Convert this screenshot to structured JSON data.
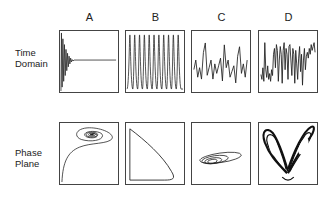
{
  "columns": [
    {
      "id": "A",
      "label": "A"
    },
    {
      "id": "B",
      "label": "B"
    },
    {
      "id": "C",
      "label": "C"
    },
    {
      "id": "D",
      "label": "D"
    }
  ],
  "rows": [
    {
      "id": "time",
      "label_line1": "Time",
      "label_line2": "Domain"
    },
    {
      "id": "phase",
      "label_line1": "Phase",
      "label_line2": "Plane"
    }
  ],
  "panels": {
    "time": [
      {
        "column": "A",
        "content": "damped oscillation decaying to steady state"
      },
      {
        "column": "B",
        "content": "periodic spikes"
      },
      {
        "column": "C",
        "content": "quasi-periodic oscillation"
      },
      {
        "column": "D",
        "content": "chaotic oscillation"
      }
    ],
    "phase": [
      {
        "column": "A",
        "content": "spiral to fixed point"
      },
      {
        "column": "B",
        "content": "limit cycle"
      },
      {
        "column": "C",
        "content": "torus-like nested loops"
      },
      {
        "column": "D",
        "content": "strange attractor (butterfly)"
      }
    ]
  },
  "colors": {
    "stroke": "#222222",
    "border": "#444444",
    "background": "#ffffff"
  }
}
